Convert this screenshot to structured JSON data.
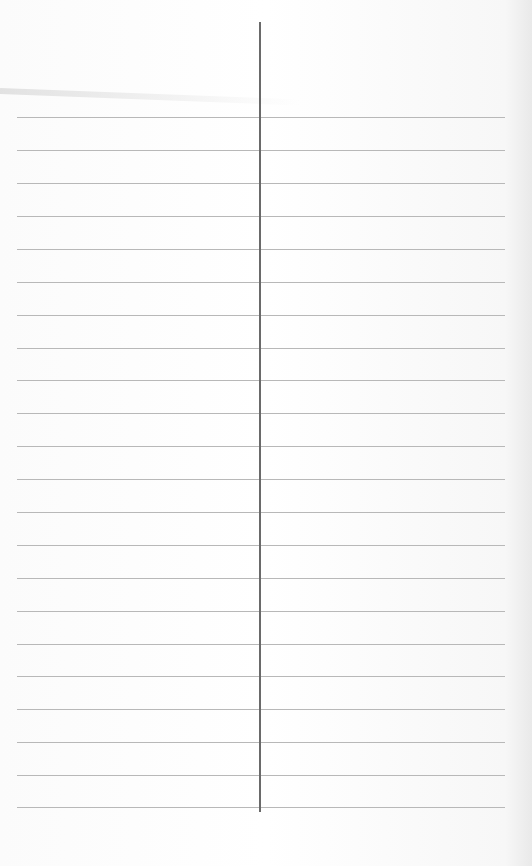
{
  "image": {
    "description": "Photo of blank lined paper divided by a vertical center line",
    "colors": {
      "paper": "#ffffff",
      "rule_line": "#b8b8b8",
      "divider": "#6a6a6a"
    },
    "horizontal_lines_y": [
      117,
      150,
      183,
      216,
      249,
      282,
      315,
      348,
      380,
      413,
      446,
      479,
      512,
      545,
      578,
      611,
      644,
      676,
      709,
      742,
      775,
      807
    ],
    "vertical_divider": {
      "x": 259,
      "y_start": 22,
      "y_end": 812
    }
  }
}
